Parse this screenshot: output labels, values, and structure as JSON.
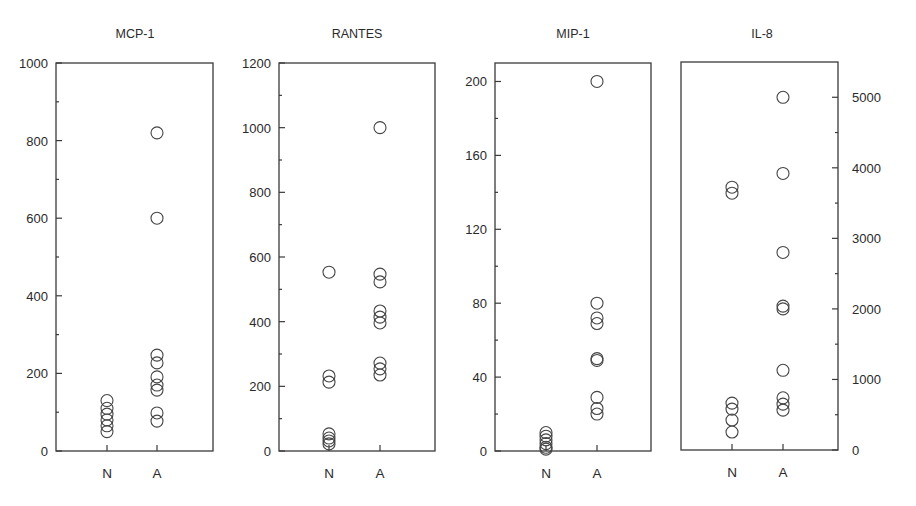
{
  "chart_data": [
    {
      "type": "scatter",
      "title": "MCP-1",
      "categories": [
        "N",
        "A"
      ],
      "ylim": [
        0,
        1000
      ],
      "yticks": [
        0,
        200,
        400,
        600,
        800,
        1000
      ],
      "yaxis_side": "left",
      "grid": false,
      "marker": "open-circle",
      "series": [
        {
          "name": "N",
          "values": [
            130,
            110,
            95,
            80,
            65,
            50
          ]
        },
        {
          "name": "A",
          "values": [
            820,
            600,
            247,
            227,
            191,
            170,
            157,
            98,
            77
          ]
        }
      ]
    },
    {
      "type": "scatter",
      "title": "RANTES",
      "categories": [
        "N",
        "A"
      ],
      "ylim": [
        0,
        1200
      ],
      "yticks": [
        0,
        200,
        400,
        600,
        800,
        1000,
        1200
      ],
      "yaxis_side": "left",
      "grid": false,
      "marker": "open-circle",
      "series": [
        {
          "name": "N",
          "values": [
            553,
            232,
            213,
            53,
            40,
            31,
            22
          ]
        },
        {
          "name": "A",
          "values": [
            1000,
            547,
            523,
            433,
            414,
            396,
            272,
            254,
            235
          ]
        }
      ]
    },
    {
      "type": "scatter",
      "title": "MIP-1",
      "categories": [
        "N",
        "A"
      ],
      "ylim": [
        0,
        210
      ],
      "yticks": [
        0,
        40,
        80,
        120,
        160,
        200
      ],
      "yaxis_side": "left",
      "grid": false,
      "marker": "open-circle",
      "series": [
        {
          "name": "N",
          "values": [
            10,
            8,
            6,
            4,
            2,
            1
          ]
        },
        {
          "name": "A",
          "values": [
            200,
            80,
            72,
            69,
            50,
            49,
            29,
            23,
            20
          ]
        }
      ]
    },
    {
      "type": "scatter",
      "title": "IL-8",
      "categories": [
        "N",
        "A"
      ],
      "ylim": [
        0,
        5500
      ],
      "yticks": [
        0,
        1000,
        2000,
        3000,
        4000,
        5000
      ],
      "yaxis_side": "right",
      "grid": false,
      "marker": "open-circle",
      "series": [
        {
          "name": "N",
          "values": [
            3725,
            3640,
            665,
            580,
            425,
            255
          ]
        },
        {
          "name": "A",
          "values": [
            5000,
            3920,
            2800,
            2040,
            2000,
            1130,
            740,
            650,
            565
          ]
        }
      ]
    }
  ],
  "layout": {
    "panels": [
      {
        "left": 56,
        "right": 213,
        "top": 63,
        "bottom": 451,
        "xN": 107,
        "xA": 157
      },
      {
        "left": 279,
        "right": 435,
        "top": 63,
        "bottom": 451,
        "xN": 329,
        "xA": 380
      },
      {
        "left": 495,
        "right": 651,
        "top": 63,
        "bottom": 451,
        "xN": 546,
        "xA": 597
      },
      {
        "left": 681,
        "right": 838,
        "top": 62,
        "bottom": 450,
        "xN": 732,
        "xA": 783
      }
    ],
    "marker_radius": 6,
    "colors": {
      "ink": "#3a3a3a",
      "background": "#ffffff"
    }
  }
}
